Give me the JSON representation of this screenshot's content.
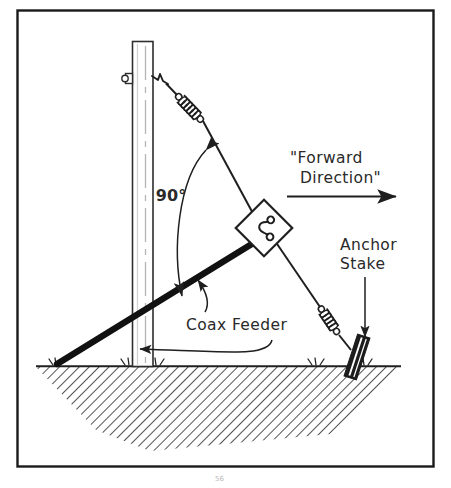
{
  "figure": {
    "border_color": "#1a1a1a",
    "background_color": "#ffffff",
    "ink_color": "#1f1f1f",
    "ground_hatch_color": "#555555",
    "mast_outline_color": "#3a3a3a",
    "mast_centerline_color": "#b0b0b0"
  },
  "labels": {
    "forward_direction_line1": "\"Forward",
    "forward_direction_line2": "Direction\"",
    "angle": "90°",
    "anchor_stake_line1": "Anchor",
    "anchor_stake_line2": "Stake",
    "coax_feeder": "Coax Feeder",
    "page_artifact": "56"
  },
  "parts": {
    "mast_name": "vertical mast",
    "guy_wire_name": "guy wire",
    "coax_feeder_name": "coax feeder line",
    "spring_upper_name": "upper tension spring",
    "spring_lower_name": "lower tension spring",
    "insulator_plate_name": "diamond junction plate",
    "anchor_stake_name": "anchor stake",
    "mast_bolt_name": "mast eye bolt",
    "ground_name": "ground hatching"
  },
  "geometry": {
    "border": {
      "x": 17,
      "y": 10,
      "width": 417,
      "height": 457
    },
    "mast": {
      "left": 132,
      "right": 153,
      "top": 41,
      "bottom": 366
    },
    "ground_line_y": 366,
    "guy_top": {
      "x": 156,
      "y": 80
    },
    "guy_anchor": {
      "x": 349,
      "y": 348
    },
    "plate_center": {
      "x": 264,
      "y": 228
    },
    "coax_ground_end": {
      "x": 57,
      "y": 364
    },
    "forward_arrow": {
      "x1": 287,
      "y1": 196,
      "x2": 400,
      "y2": 196
    }
  }
}
